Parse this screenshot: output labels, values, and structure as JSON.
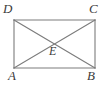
{
  "figure": {
    "kind": "geometry-diagram",
    "background_color": "#ffffff",
    "stroke_color": "#7c7c7c",
    "label_color": "#3b3b3b",
    "stroke_width": 1,
    "rectangle": {
      "left": 14,
      "top": 20,
      "right": 95,
      "bottom": 68
    },
    "vertices": [
      {
        "id": "D",
        "label": "D",
        "x": 14,
        "y": 20,
        "position": "top-left"
      },
      {
        "id": "C",
        "label": "C",
        "x": 95,
        "y": 20,
        "position": "top-right"
      },
      {
        "id": "A",
        "label": "A",
        "x": 14,
        "y": 68,
        "position": "bottom-left"
      },
      {
        "id": "B",
        "label": "B",
        "x": 95,
        "y": 68,
        "position": "bottom-right"
      }
    ],
    "intersection": {
      "id": "E",
      "label": "E",
      "x": 54.5,
      "y": 44
    },
    "edges": [
      {
        "from": "D",
        "to": "C",
        "type": "side"
      },
      {
        "from": "C",
        "to": "B",
        "type": "side"
      },
      {
        "from": "B",
        "to": "A",
        "type": "side"
      },
      {
        "from": "A",
        "to": "D",
        "type": "side"
      },
      {
        "from": "A",
        "to": "C",
        "type": "diagonal"
      },
      {
        "from": "D",
        "to": "B",
        "type": "diagonal"
      }
    ]
  }
}
